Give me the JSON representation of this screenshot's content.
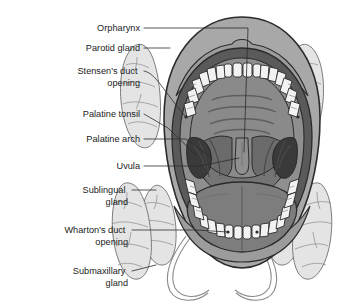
{
  "figure": {
    "background_color": "#ffffff",
    "width": 343,
    "height": 308
  },
  "labels": [
    {
      "id": "orpharynx",
      "text": "Orpharynx",
      "lines": [
        "Orpharynx"
      ],
      "x": 140,
      "y": 31
    },
    {
      "id": "parotid-gland",
      "text": "Parotid gland",
      "lines": [
        "Parotid gland"
      ],
      "x": 140,
      "y": 51
    },
    {
      "id": "stensens-duct",
      "text": "Stensen's duct opening",
      "lines": [
        "Stensen's duct",
        "opening"
      ],
      "x": 140,
      "y": 77
    },
    {
      "id": "palatine-tonsil",
      "text": "Palatine tonsil",
      "lines": [
        "Palatine tonsil"
      ],
      "x": 140,
      "y": 117
    },
    {
      "id": "palatine-arch",
      "text": "Palatine arch",
      "lines": [
        "Palatine arch"
      ],
      "x": 140,
      "y": 142
    },
    {
      "id": "uvula",
      "text": "Uvula",
      "lines": [
        "Uvula"
      ],
      "x": 140,
      "y": 169
    },
    {
      "id": "sublingual-gland",
      "text": "Sublingual gland",
      "lines": [
        "Sublingual",
        "gland"
      ],
      "x": 128,
      "y": 196
    },
    {
      "id": "whartons-duct",
      "text": "Wharton's duct opening",
      "lines": [
        "Wharton's duct",
        "opening"
      ],
      "x": 128,
      "y": 236
    },
    {
      "id": "submaxillary-gland",
      "text": "Submaxillary gland",
      "lines": [
        "Submaxillary",
        "gland"
      ],
      "x": 128,
      "y": 277
    }
  ],
  "colors": {
    "outline": "#2b2b2b",
    "leader_line": "#2b2b2b",
    "label_text": "#1b1b1b",
    "lip_outer": "#a8a8a8",
    "lip_inner": "#5a5a5a",
    "gum": "#8f8f8f",
    "palate": "#8a8a8a",
    "palate_rugae": "#5e5e5e",
    "tongue": "#7d7d7d",
    "tongue_shadow": "#6d6d6d",
    "tonsil_dark": "#3a3a3a",
    "tooth": "#f2f2f2",
    "gland_fill": "#e4e4e4",
    "gland_stroke": "#6e6e6e",
    "duct_stroke": "#8a8a8a"
  },
  "anatomy": {
    "parts": [
      {
        "id": "upper-lip",
        "name": "Upper lip"
      },
      {
        "id": "lower-lip",
        "name": "Lower lip"
      },
      {
        "id": "upper-teeth-arch",
        "name": "Upper dental arch",
        "tooth_count": 16
      },
      {
        "id": "lower-teeth-arch",
        "name": "Lower dental arch",
        "tooth_count": 16
      },
      {
        "id": "hard-palate",
        "name": "Hard palate with rugae",
        "rugae_count": 4
      },
      {
        "id": "soft-palate",
        "name": "Soft palate"
      },
      {
        "id": "uvula",
        "name": "Uvula"
      },
      {
        "id": "palatine-arch-left",
        "name": "Left palatine arch"
      },
      {
        "id": "palatine-arch-right",
        "name": "Right palatine arch"
      },
      {
        "id": "palatine-tonsil-left",
        "name": "Left palatine tonsil"
      },
      {
        "id": "palatine-tonsil-right",
        "name": "Right palatine tonsil"
      },
      {
        "id": "oropharynx",
        "name": "Oropharynx"
      },
      {
        "id": "tongue",
        "name": "Tongue"
      },
      {
        "id": "parotid-gland-left",
        "name": "Left parotid gland"
      },
      {
        "id": "parotid-gland-right",
        "name": "Right parotid gland"
      },
      {
        "id": "sublingual-gland-left",
        "name": "Left sublingual gland"
      },
      {
        "id": "sublingual-gland-right",
        "name": "Right sublingual gland"
      },
      {
        "id": "submaxillary-gland-left",
        "name": "Left submaxillary gland"
      },
      {
        "id": "submaxillary-gland-right",
        "name": "Right submaxillary gland"
      },
      {
        "id": "whartons-duct-left",
        "name": "Left Wharton's duct"
      },
      {
        "id": "whartons-duct-right",
        "name": "Right Wharton's duct"
      }
    ]
  }
}
